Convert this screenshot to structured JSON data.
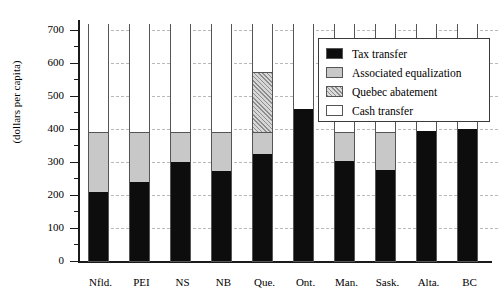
{
  "chart_data": {
    "type": "bar",
    "title": "",
    "subtitle": "",
    "xlabel": "",
    "ylabel": "(dollars per capita)",
    "ylim": [
      0,
      730
    ],
    "grid": true,
    "stacked": true,
    "legend_position": "top-right",
    "categories": [
      "Nfld.",
      "PEI",
      "NS",
      "NB",
      "Que.",
      "Ont.",
      "Man.",
      "Sask.",
      "Alta.",
      "BC"
    ],
    "yticks": [
      0,
      100,
      200,
      300,
      400,
      500,
      600,
      700
    ],
    "ytick_labels": [
      "0",
      "100",
      "200",
      "300",
      "400",
      "500",
      "600",
      "700"
    ],
    "series": [
      {
        "name": "Tax transfer",
        "color": "#0d0d0d",
        "values": [
          210,
          240,
          300,
          272,
          325,
          460,
          303,
          275,
          393,
          400
        ]
      },
      {
        "name": "Associated equalization",
        "color": "#c8c8c8",
        "values": [
          180,
          150,
          90,
          118,
          65,
          0,
          87,
          115,
          0,
          0
        ]
      },
      {
        "name": "Quebec abatement",
        "color": "#d7d7d7",
        "values": [
          0,
          0,
          0,
          0,
          182,
          0,
          0,
          0,
          0,
          0
        ]
      },
      {
        "name": "Cash transfer",
        "color": "#ffffff",
        "values": [
          331,
          331,
          331,
          331,
          149,
          261,
          331,
          331,
          328,
          321
        ]
      }
    ],
    "stack_tops": [
      721,
      721,
      721,
      721,
      721,
      721,
      721,
      721,
      721,
      721
    ]
  },
  "legend": {
    "items": [
      {
        "label": "Tax transfer",
        "swatch": "solid-black-swatch"
      },
      {
        "label": "Associated equalization",
        "swatch": "solid-gray-swatch"
      },
      {
        "label": "Quebec abatement",
        "swatch": "hatched-gray-swatch"
      },
      {
        "label": "Cash transfer",
        "swatch": "open-white-swatch"
      }
    ]
  }
}
